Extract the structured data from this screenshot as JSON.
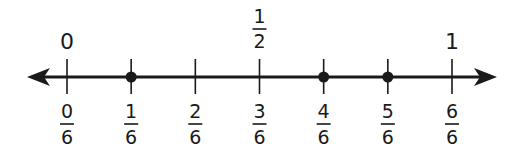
{
  "number_line": {
    "min": 0,
    "max": 1,
    "denominator": 6,
    "arrows": "both",
    "top_labels": [
      {
        "value": 0,
        "text": "0"
      },
      {
        "value": 0.5,
        "numerator": "1",
        "denominator": "2"
      },
      {
        "value": 1,
        "text": "1"
      }
    ],
    "bottom_labels": [
      {
        "numerator": "0",
        "denominator": "6"
      },
      {
        "numerator": "1",
        "denominator": "6"
      },
      {
        "numerator": "2",
        "denominator": "6"
      },
      {
        "numerator": "3",
        "denominator": "6"
      },
      {
        "numerator": "4",
        "denominator": "6"
      },
      {
        "numerator": "5",
        "denominator": "6"
      },
      {
        "numerator": "6",
        "denominator": "6"
      }
    ],
    "points": [
      1,
      4,
      5
    ],
    "colors": {
      "line": "#1a1a1a",
      "text": "#1a1a1a"
    }
  }
}
